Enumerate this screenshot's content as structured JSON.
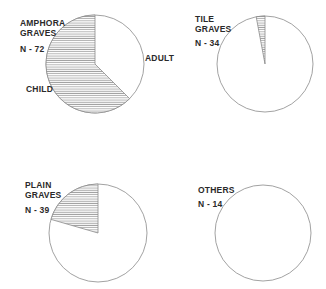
{
  "chart_data": [
    {
      "type": "pie",
      "title": "AMPHORA GRAVES",
      "n_label": "N - 72",
      "n": 72,
      "categories": [
        "ADULT",
        "CHILD"
      ],
      "values": [
        27,
        45
      ],
      "hatched": [
        "CHILD"
      ],
      "slice_labels": {
        "adult": "ADULT",
        "child": "CHILD"
      }
    },
    {
      "type": "pie",
      "title": "TILE GRAVES",
      "n_label": "N - 34",
      "n": 34,
      "categories": [
        "ADULT",
        "CHILD"
      ],
      "values": [
        33,
        1
      ],
      "hatched": [
        "CHILD"
      ]
    },
    {
      "type": "pie",
      "title": "PLAIN GRAVES",
      "n_label": "N - 39",
      "n": 39,
      "categories": [
        "ADULT",
        "CHILD"
      ],
      "values": [
        31,
        8
      ],
      "hatched": [
        "CHILD"
      ]
    },
    {
      "type": "pie",
      "title": "OTHERS",
      "n_label": "N - 14",
      "n": 14,
      "categories": [
        "ADULT",
        "CHILD"
      ],
      "values": [
        14,
        0
      ],
      "hatched": [
        "CHILD"
      ]
    }
  ],
  "labels": {
    "p1_line1": "AMPHORA",
    "p1_line2": "GRAVES",
    "p1_n": "N - 72",
    "p1_adult": "ADULT",
    "p1_child": "CHILD",
    "p2_line1": "TILE",
    "p2_line2": "GRAVES",
    "p2_n": "N - 34",
    "p3_line1": "PLAIN",
    "p3_line2": "GRAVES",
    "p3_n": "N - 39",
    "p4_line1": "OTHERS",
    "p4_n": "N - 14"
  },
  "colors": {
    "outline": "#8a8a8a",
    "hatch": "#9a9a9a",
    "text": "#2a2a2a",
    "background": "#ffffff"
  }
}
